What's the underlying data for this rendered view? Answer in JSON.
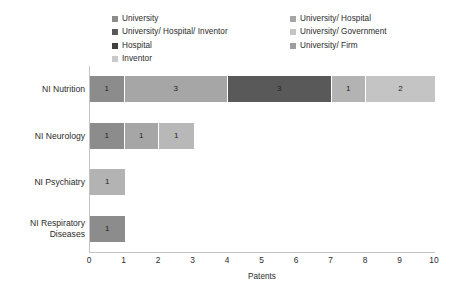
{
  "chart_data": {
    "type": "bar",
    "orientation": "horizontal",
    "stacked": true,
    "title": "",
    "xlabel": "Patents",
    "ylabel": "",
    "xlim": [
      0,
      10
    ],
    "xticks": [
      "0",
      "1",
      "2",
      "3",
      "4",
      "5",
      "6",
      "7",
      "8",
      "9",
      "10"
    ],
    "grid": false,
    "legend_position": "top",
    "categories": [
      "NI Nutrition",
      "NI Neurology",
      "NI Psychiatry",
      "NI Respiratory Diseases"
    ],
    "series": [
      {
        "name": "University",
        "color": "#8c8c8c",
        "values": [
          1,
          1,
          0,
          1
        ]
      },
      {
        "name": "University/ Hospital",
        "color": "#a6a6a6",
        "values": [
          3,
          1,
          0,
          0
        ]
      },
      {
        "name": "University/ Hospital/ Inventor",
        "color": "#595959",
        "values": [
          3,
          0,
          0,
          0
        ]
      },
      {
        "name": "University/ Government",
        "color": "#b3b3b3",
        "values": [
          1,
          1,
          1,
          0
        ]
      },
      {
        "name": "Hospital",
        "color": "#404040",
        "values": [
          0,
          0,
          0,
          0
        ]
      },
      {
        "name": "University/ Firm",
        "color": "#c4c4c4",
        "values": [
          2,
          0,
          0,
          0
        ]
      },
      {
        "name": "Inventor",
        "color": "#d4d4d4",
        "values": [
          0,
          0,
          0,
          0
        ]
      }
    ],
    "bars": [
      {
        "category": "NI Nutrition",
        "segments": [
          {
            "series": "University",
            "value": 1,
            "label": "1",
            "color": "#8c8c8c"
          },
          {
            "series": "University/ Hospital",
            "value": 3,
            "label": "3",
            "color": "#a6a6a6"
          },
          {
            "series": "University/ Hospital/ Inventor",
            "value": 3,
            "label": "3",
            "color": "#595959"
          },
          {
            "series": "University/ Government",
            "value": 1,
            "label": "1",
            "color": "#b3b3b3"
          },
          {
            "series": "University/ Firm",
            "value": 2,
            "label": "2",
            "color": "#c4c4c4"
          }
        ],
        "total": 10
      },
      {
        "category": "NI Neurology",
        "segments": [
          {
            "series": "University",
            "value": 1,
            "label": "1",
            "color": "#8c8c8c"
          },
          {
            "series": "University/ Hospital",
            "value": 1,
            "label": "1",
            "color": "#a6a6a6"
          },
          {
            "series": "University/ Government",
            "value": 1,
            "label": "1",
            "color": "#b8b8b8"
          }
        ],
        "total": 3
      },
      {
        "category": "NI Psychiatry",
        "segments": [
          {
            "series": "University/ Government",
            "value": 1,
            "label": "1",
            "color": "#b3b3b3"
          }
        ],
        "total": 1
      },
      {
        "category": "NI Respiratory Diseases",
        "segments": [
          {
            "series": "University",
            "value": 1,
            "label": "1",
            "color": "#8c8c8c"
          }
        ],
        "total": 1
      }
    ]
  },
  "legend": {
    "items": [
      {
        "label": "University",
        "color": "#8c8c8c"
      },
      {
        "label": "University/ Hospital/ Inventor",
        "color": "#595959"
      },
      {
        "label": "Hospital",
        "color": "#404040"
      },
      {
        "label": "Inventor",
        "color": "#c9c9c9"
      },
      {
        "label": "University/ Hospital",
        "color": "#a6a6a6"
      },
      {
        "label": "University/ Government",
        "color": "#c4c4c4"
      },
      {
        "label": "University/ Firm",
        "color": "#9e9e9e"
      }
    ]
  },
  "axis": {
    "x_title": "Patents",
    "x_ticks": [
      "0",
      "1",
      "2",
      "3",
      "4",
      "5",
      "6",
      "7",
      "8",
      "9",
      "10"
    ],
    "y_categories": [
      "NI Nutrition",
      "NI Neurology",
      "NI Psychiatry",
      "NI Respiratory Diseases"
    ]
  },
  "colors": {
    "axis_line": "#c3c3c3",
    "text": "#2b2b2b",
    "background": "#ffffff"
  }
}
